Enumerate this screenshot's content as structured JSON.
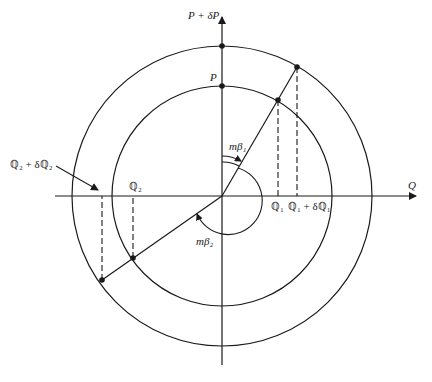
{
  "diagram": {
    "colors": {
      "stroke": "#1a1a1a",
      "background": "#ffffff"
    },
    "axes": {
      "horizontal_label": "Q",
      "vertical_label": "P + δP"
    },
    "labels": {
      "p_inner": "P",
      "q1": "ℚ₁",
      "q1_plus": "ℚ₁ + δℚ₁",
      "q2": "ℚ₂",
      "q2_plus": "ℚ₂ + δℚ₂",
      "m_beta1": "mβ₁",
      "m_beta2": "mβ₂"
    },
    "circles": [
      {
        "name": "inner",
        "radius_label": "P"
      },
      {
        "name": "outer",
        "radius_label": "P + δP"
      }
    ],
    "points": [
      "P",
      "P + δP",
      "inner-beta1",
      "outer-beta1",
      "inner-beta2",
      "outer-beta2"
    ]
  }
}
